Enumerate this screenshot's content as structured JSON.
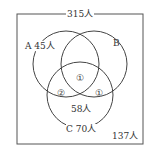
{
  "diagram": {
    "type": "venn",
    "universe": {
      "label": "315人",
      "total": 315
    },
    "outside": {
      "label": "137人",
      "value": 137
    },
    "sets": [
      {
        "name": "A",
        "label": "A 45人",
        "total": 45
      },
      {
        "name": "B",
        "label": "B"
      },
      {
        "name": "C",
        "label": "C 70人",
        "total": 70
      }
    ],
    "regions": {
      "a_b_c_top": "①",
      "a_c": "②",
      "b_c": "①",
      "c_only": "58人"
    },
    "colors": {
      "stroke": "#444444",
      "background": "#ffffff"
    }
  }
}
